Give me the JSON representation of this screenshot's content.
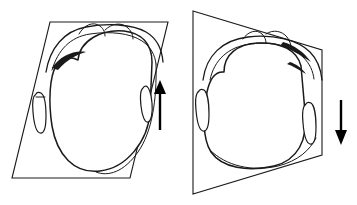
{
  "figure": {
    "background_color": "#ffffff",
    "line_color": "#1a1a1a",
    "accent_color": "#000000",
    "width": 357,
    "height": 205
  },
  "panels": [
    {
      "id": "left-panel",
      "name": "left-panel",
      "plane_name": "parallelogram-plane",
      "plane_shape": "parallelogram",
      "plane_points": "50,22 168,22 130,178 12,178",
      "object_name": "bag-body-left",
      "object_label": "",
      "arrow": {
        "name": "up-arrow",
        "direction": "up",
        "glyph": "↑",
        "x": 160,
        "y_tail": 130,
        "y_tip": 82
      },
      "side_tabs": 2,
      "caption": ""
    },
    {
      "id": "right-panel",
      "name": "right-panel",
      "plane_name": "trapezoid-plane",
      "plane_shape": "trapezoid",
      "plane_points": "193,11 322,50 322,155 193,194",
      "object_name": "bag-body-right",
      "object_label": "",
      "arrow": {
        "name": "down-arrow",
        "direction": "down",
        "glyph": "↓",
        "x": 341,
        "y_tail": 100,
        "y_tip": 143
      },
      "side_tabs": 2,
      "caption": ""
    }
  ],
  "annotations": {
    "figure_caption": "",
    "left_caption": "",
    "right_caption": ""
  }
}
